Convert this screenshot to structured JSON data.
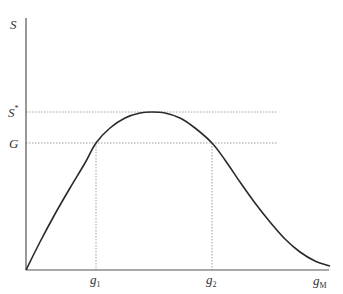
{
  "chart_data": {
    "type": "line",
    "title": "",
    "xlabel": "g_M",
    "ylabel": "S",
    "grid": false,
    "legend": null,
    "x_ticks": [
      {
        "label": "g",
        "sub": "1",
        "px": 96
      },
      {
        "label": "g",
        "sub": "2",
        "px": 212
      }
    ],
    "y_ticks": [
      {
        "label": "S",
        "sup": "*",
        "py": 112
      },
      {
        "label": "G",
        "sup": "",
        "py": 143
      }
    ],
    "series": [
      {
        "name": "S(g_M)",
        "description": "hump-shaped curve starting at origin, peaking at S* between g1 and g2, crossing G at g1 and g2, then decaying toward the right end",
        "points_px": [
          [
            26,
            270
          ],
          [
            40,
            242
          ],
          [
            55,
            214
          ],
          [
            70,
            188
          ],
          [
            85,
            163
          ],
          [
            96,
            143
          ],
          [
            110,
            128
          ],
          [
            125,
            118
          ],
          [
            140,
            113
          ],
          [
            152,
            112
          ],
          [
            165,
            113
          ],
          [
            180,
            118
          ],
          [
            195,
            128
          ],
          [
            212,
            143
          ],
          [
            225,
            160
          ],
          [
            240,
            182
          ],
          [
            255,
            203
          ],
          [
            270,
            222
          ],
          [
            285,
            239
          ],
          [
            300,
            252
          ],
          [
            315,
            261
          ],
          [
            330,
            266
          ]
        ]
      }
    ],
    "reference_lines": [
      {
        "type": "horizontal",
        "label": "S*",
        "py": 112,
        "x_from": 26,
        "x_to": 278,
        "style": "dotted"
      },
      {
        "type": "horizontal",
        "label": "G",
        "py": 143,
        "x_from": 26,
        "x_to": 278,
        "style": "dotted"
      },
      {
        "type": "vertical",
        "label": "g1",
        "px": 96,
        "y_from": 143,
        "y_to": 270,
        "style": "dotted"
      },
      {
        "type": "vertical",
        "label": "g2",
        "px": 212,
        "y_from": 143,
        "y_to": 270,
        "style": "dotted"
      }
    ],
    "axes": {
      "origin_px": [
        26,
        270
      ],
      "x_end_px": 329,
      "y_top_px": 18
    }
  },
  "labels": {
    "y_axis": "S",
    "x_axis_main": "g",
    "x_axis_sub": "M",
    "s_star_main": "S",
    "s_star_sup": "*",
    "g_level": "G",
    "g1_main": "g",
    "g1_sub": "1",
    "g2_main": "g",
    "g2_sub": "2"
  },
  "colors": {
    "curve": "#2a2a2a",
    "axis": "#555555",
    "dotted": "#888888",
    "text": "#333333"
  }
}
